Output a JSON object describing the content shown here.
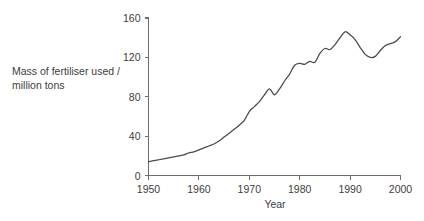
{
  "chart_data": {
    "type": "line",
    "title": "",
    "xlabel": "Year",
    "ylabel": "Mass of fertiliser used / million tons",
    "ylabel_line1": "Mass of fertiliser used /",
    "ylabel_line2": "million tons",
    "xlim": [
      1950,
      2000
    ],
    "ylim": [
      0,
      160
    ],
    "xticks": [
      1950,
      1960,
      1970,
      1980,
      1990,
      2000
    ],
    "xtick_labels": [
      "1950",
      "1960",
      "1970",
      "1980",
      "1990",
      "2000"
    ],
    "yticks": [
      0,
      40,
      80,
      120,
      160
    ],
    "ytick_labels": [
      "0",
      "40",
      "80",
      "120",
      "160"
    ],
    "grid": false,
    "legend": false,
    "line_color": "#4a4a4a",
    "axis_color": "#6e6e6e",
    "background_color": "#ffffff",
    "series": [
      {
        "name": "Mass of fertiliser used",
        "x": [
          1950,
          1951,
          1952,
          1953,
          1954,
          1955,
          1956,
          1957,
          1958,
          1959,
          1960,
          1961,
          1962,
          1963,
          1964,
          1965,
          1966,
          1967,
          1968,
          1969,
          1970,
          1971,
          1972,
          1973,
          1974,
          1975,
          1976,
          1977,
          1978,
          1979,
          1980,
          1981,
          1982,
          1983,
          1984,
          1985,
          1986,
          1987,
          1988,
          1989,
          1990,
          1991,
          1992,
          1993,
          1994,
          1995,
          1996,
          1997,
          1998,
          1999,
          2000
        ],
        "values": [
          14,
          15,
          16,
          17,
          18,
          19,
          20,
          21,
          23,
          24,
          26,
          28,
          30,
          32,
          35,
          39,
          43,
          47,
          51,
          56,
          65,
          70,
          75,
          82,
          88,
          82,
          88,
          96,
          103,
          112,
          114,
          113,
          116,
          115,
          124,
          129,
          128,
          133,
          140,
          146,
          143,
          138,
          130,
          123,
          120,
          121,
          127,
          132,
          134,
          136,
          141
        ]
      }
    ]
  }
}
